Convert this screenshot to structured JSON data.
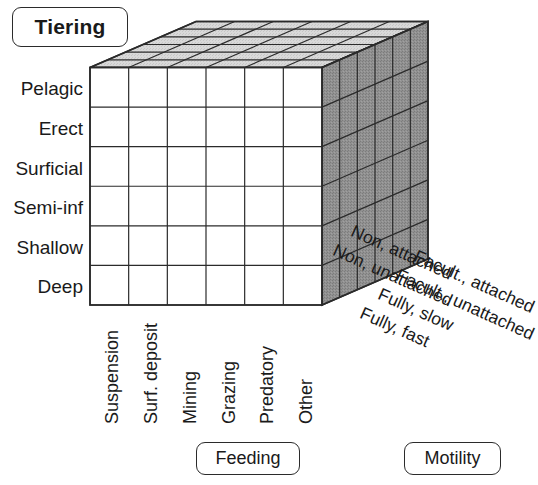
{
  "figure": {
    "type": "3d-ecospace-cube"
  },
  "axes": {
    "tiering": {
      "label": "Tiering",
      "categories": [
        "Pelagic",
        "Erect",
        "Surficial",
        "Semi-inf",
        "Shallow",
        "Deep"
      ]
    },
    "feeding": {
      "label": "Feeding",
      "categories": [
        "Suspension",
        "Surf. deposit",
        "Mining",
        "Grazing",
        "Predatory",
        "Other"
      ]
    },
    "motility": {
      "label": "Motility",
      "categories": [
        "Non, attached",
        "Non, unattached",
        "Facult., attached",
        "Facult., unattached",
        "Fully, slow",
        "Fully, fast"
      ]
    }
  },
  "cube": {
    "rows": 6,
    "cols": 6,
    "depth": 6,
    "front_face_fill": "#ffffff",
    "top_face_fill": "#d6d6d6",
    "side_face_fill": "#8e8e8e",
    "line_color": "#2b2b2b"
  }
}
